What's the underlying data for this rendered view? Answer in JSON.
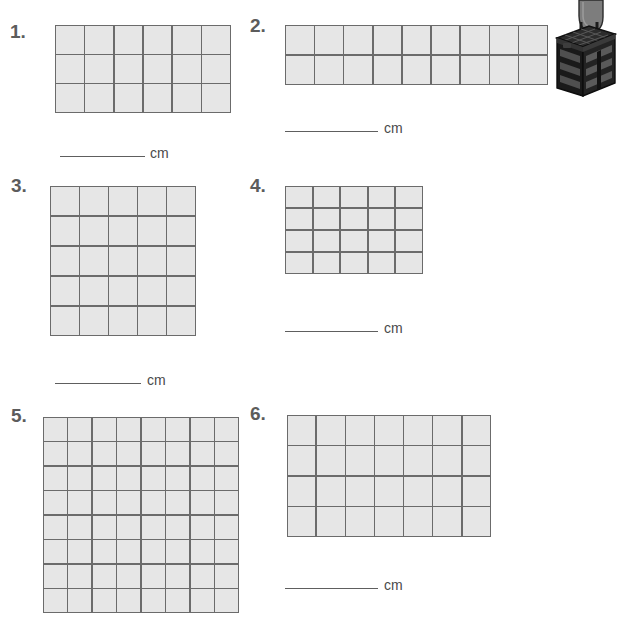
{
  "worksheet": {
    "unit_label": "cm",
    "grid_colors": {
      "cell_fill": "#e6e6e6",
      "grid_line": "#6b6b6b",
      "number_color": "#5c5c5c",
      "answer_line_color": "#5e5e5e"
    },
    "problems": [
      {
        "number": "1.",
        "columns": 6,
        "rows": 3,
        "unit": "cm"
      },
      {
        "number": "2.",
        "columns": 9,
        "rows": 2,
        "unit": "cm"
      },
      {
        "number": "3.",
        "columns": 5,
        "rows": 5,
        "unit": "cm"
      },
      {
        "number": "4.",
        "columns": 5,
        "rows": 4,
        "unit": "cm"
      },
      {
        "number": "5.",
        "columns": 8,
        "rows": 8,
        "unit": "cm"
      },
      {
        "number": "6.",
        "columns": 7,
        "rows": 4,
        "unit": "cm"
      }
    ]
  },
  "illustration": {
    "name": "black-crate-with-handle",
    "body_color": "#1c1c1c",
    "panel_color": "#4a4a4a",
    "handle_color": "#6e6e6e"
  }
}
